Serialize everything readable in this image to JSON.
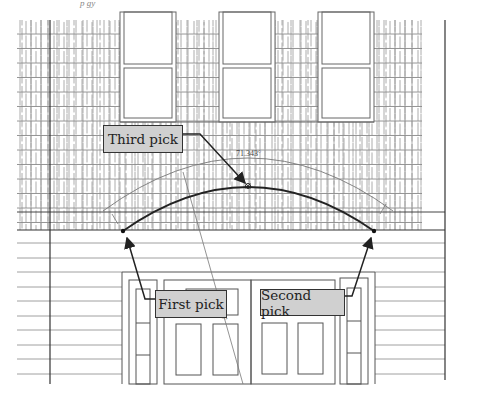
{
  "figure": {
    "top_caption_fragment": "p  gy",
    "callouts": [
      {
        "id": "third",
        "label": "Third pick"
      },
      {
        "id": "first",
        "label": "First pick"
      },
      {
        "id": "second",
        "label": "Second pick"
      }
    ],
    "dimensions": {
      "angle": "71.343°",
      "radius": "4.200'"
    },
    "colors": {
      "line": "#555555",
      "arc": "#222222",
      "callout_fill": "#d0d0d0",
      "callout_border": "#333333"
    }
  }
}
